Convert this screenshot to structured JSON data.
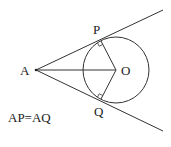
{
  "diagram": {
    "colors": {
      "stroke": "#333333",
      "text": "#222222",
      "background": "#ffffff"
    },
    "points": {
      "A": {
        "label": "A",
        "x": 36,
        "y": 70
      },
      "O": {
        "label": "O",
        "x": 116,
        "y": 70
      },
      "P": {
        "label": "P",
        "x": 101,
        "y": 41
      },
      "Q": {
        "label": "Q",
        "x": 101,
        "y": 99
      }
    },
    "circle": {
      "center": "O",
      "cx": 116,
      "cy": 70,
      "r": 33
    },
    "segments": [
      {
        "from": "A",
        "to": "O"
      },
      {
        "from": "O",
        "to": "P"
      },
      {
        "from": "O",
        "to": "Q"
      }
    ],
    "tangent_lines": [
      {
        "from": "A",
        "through": "P",
        "end_x": 163,
        "end_y": 10
      },
      {
        "from": "A",
        "through": "Q",
        "end_x": 163,
        "end_y": 131
      }
    ],
    "right_angle_marks": [
      "P",
      "Q"
    ],
    "labels": {
      "A": "A",
      "O": "O",
      "P": "P",
      "Q": "Q"
    },
    "equation": "AP=AQ"
  }
}
